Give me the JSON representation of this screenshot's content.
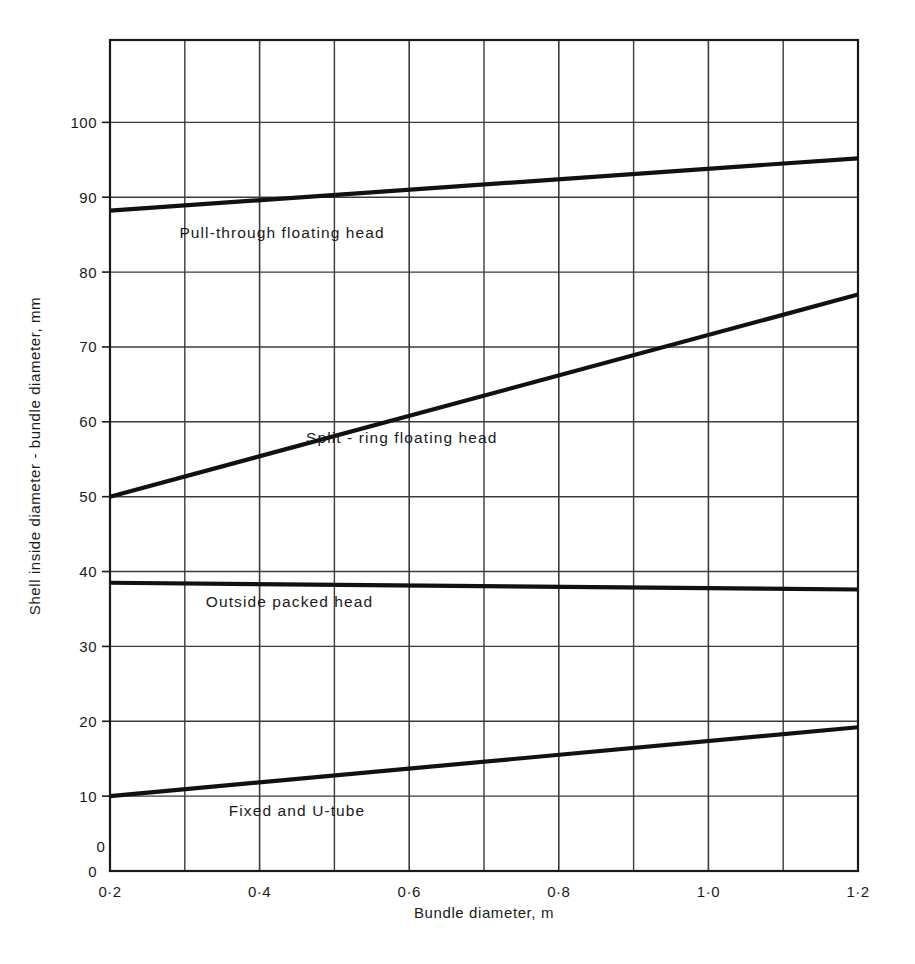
{
  "chart_data": {
    "type": "line",
    "title": "",
    "xlabel": "Bundle diameter,  m",
    "ylabel": "Shell inside diameter - bundle diameter,  mm",
    "xlim": [
      0.2,
      1.2
    ],
    "ylim": [
      0,
      111
    ],
    "grid": true,
    "legend_position": "inline-annotations",
    "x_major_ticks": [
      0.2,
      0.4,
      0.6,
      0.8,
      1.0,
      1.2
    ],
    "x_major_tick_labels": [
      "0·2",
      "0·4",
      "0·6",
      "0·8",
      "1·0",
      "1·2"
    ],
    "x_minor_ticks": [
      0.3,
      0.5,
      0.7,
      0.9,
      1.1
    ],
    "y_ticks": [
      0,
      10,
      20,
      30,
      40,
      50,
      60,
      70,
      80,
      90,
      100
    ],
    "y_tick_labels": [
      "0",
      "10",
      "20",
      "30",
      "40",
      "50",
      "60",
      "70",
      "80",
      "90",
      "100"
    ],
    "origin_label": "0",
    "line_color": "#111111",
    "grid_color": "#3b3b3b",
    "series": [
      {
        "name": "Pull-through floating head",
        "label": "Pull-through floating head",
        "label_x": 0.43,
        "label_y": 84.5,
        "x": [
          0.2,
          1.2
        ],
        "values": [
          88.2,
          95.2
        ]
      },
      {
        "name": "Split - ring floating head",
        "label": "Split - ring floating head",
        "label_x": 0.59,
        "label_y": 57.2,
        "x": [
          0.2,
          1.2
        ],
        "values": [
          50.0,
          77.0
        ]
      },
      {
        "name": "Outside packed head",
        "label": "Outside packed head",
        "label_x": 0.44,
        "label_y": 35.2,
        "x": [
          0.2,
          1.2
        ],
        "values": [
          38.5,
          37.6
        ]
      },
      {
        "name": "Fixed and U-tube",
        "label": "Fixed and U-tube",
        "label_x": 0.45,
        "label_y": 7.4,
        "x": [
          0.2,
          1.2
        ],
        "values": [
          10.0,
          19.2
        ]
      }
    ]
  }
}
